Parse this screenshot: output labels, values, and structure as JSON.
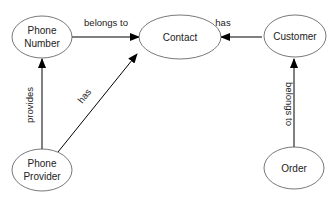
{
  "diagram": {
    "nodes": [
      {
        "id": "phone_number",
        "lines": [
          "Phone",
          "Number"
        ]
      },
      {
        "id": "contact",
        "lines": [
          "Contact"
        ]
      },
      {
        "id": "customer",
        "lines": [
          "Customer"
        ]
      },
      {
        "id": "phone_provider",
        "lines": [
          "Phone",
          "Provider"
        ]
      },
      {
        "id": "order",
        "lines": [
          "Order"
        ]
      }
    ],
    "edges": [
      {
        "from": "phone_number",
        "to": "contact",
        "label": "belongs to"
      },
      {
        "from": "customer",
        "to": "contact",
        "label": "has"
      },
      {
        "from": "phone_provider",
        "to": "phone_number",
        "label": "provides"
      },
      {
        "from": "phone_provider",
        "to": "contact",
        "label": "has"
      },
      {
        "from": "order",
        "to": "customer",
        "label": "belongs to"
      }
    ]
  }
}
